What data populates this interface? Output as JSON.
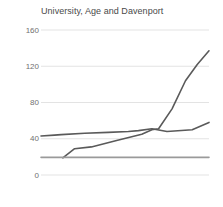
{
  "chart_data": {
    "type": "line",
    "title": "University, Age and Davenport",
    "xlabel": "",
    "ylabel": "",
    "ylim": [
      0,
      160
    ],
    "xlim": [
      0,
      100
    ],
    "yticks": [
      0,
      40,
      80,
      120,
      160
    ],
    "ytick_labels": [
      "0",
      "40",
      "80",
      "120",
      "160"
    ],
    "xticks": [],
    "xtick_labels": [],
    "grid": true,
    "grid_axis": "y",
    "legend": false,
    "legend_position": "none",
    "background": "#ffffff",
    "grid_color": "#e3e3e3",
    "series": [
      {
        "name": "University",
        "color": "#5a5a5a",
        "x": [
          0,
          8,
          12,
          26,
          40,
          52,
          58,
          66,
          75,
          90,
          100
        ],
        "values": [
          43,
          44,
          44.5,
          46,
          47,
          48,
          49,
          51,
          48,
          50,
          58
        ]
      },
      {
        "name": "Age",
        "color": "#5a5a5a",
        "x": [
          13,
          20,
          30,
          45,
          60,
          66,
          70,
          78,
          86,
          93,
          100
        ],
        "values": [
          19,
          29,
          31,
          38,
          45,
          50,
          51,
          73,
          104,
          122,
          137
        ]
      },
      {
        "name": "Davenport",
        "color": "#9a9a9a",
        "x": [
          0,
          100
        ],
        "values": [
          19.5,
          19.5
        ]
      }
    ]
  }
}
